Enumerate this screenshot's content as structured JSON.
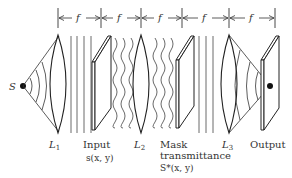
{
  "diagram": {
    "dimension_label": "f",
    "dimension_segments": 5,
    "source_label": "S",
    "labels": {
      "lens1": "L",
      "lens1_sub": "1",
      "input": "Input",
      "input_func": "s(x, y)",
      "lens2": "L",
      "lens2_sub": "2",
      "mask": "Mask",
      "mask_line2": "transmittance",
      "mask_func": "S*(x, y)",
      "lens3": "L",
      "lens3_sub": "3",
      "output": "Output"
    },
    "colors": {
      "line": "#222222",
      "text": "#333333",
      "background": "#ffffff"
    }
  }
}
